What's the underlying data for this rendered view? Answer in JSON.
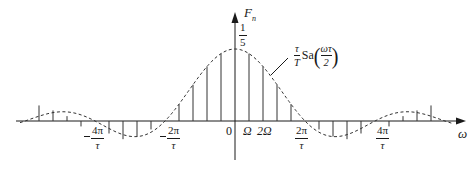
{
  "figure": {
    "y_axis_label": "F",
    "y_axis_subscript": "n",
    "x_axis_label": "ω",
    "peak_value": {
      "numerator": "1",
      "denominator": "5"
    },
    "origin_label": "0",
    "omega_labels": [
      "Ω",
      "2Ω"
    ],
    "envelope_annotation": {
      "coef_num": "τ",
      "coef_den": "T",
      "func": "Sa",
      "arg_num": "ωτ",
      "arg_den": "2"
    },
    "tick_labels": [
      {
        "id": "neg-4pi",
        "numerator": "4π",
        "denominator": "τ",
        "negative": true
      },
      {
        "id": "neg-2pi",
        "numerator": "2π",
        "denominator": "τ",
        "negative": true
      },
      {
        "id": "pos-2pi",
        "numerator": "2π",
        "denominator": "τ",
        "negative": false
      },
      {
        "id": "pos-4pi",
        "numerator": "4π",
        "denominator": "τ",
        "negative": false
      }
    ],
    "colors": {
      "ink": "#1a1a1a",
      "line": "#333333",
      "background": "#ffffff"
    }
  },
  "chart_data": {
    "type": "line",
    "xlabel": "ω",
    "ylabel": "F_n",
    "envelope": "(τ/T)·Sa(ωτ/2)",
    "duty_ratio": "1/5",
    "peak": 0.2,
    "harmonic_spacing": "Ω",
    "zero_crossings": [
      "-4π/τ",
      "-2π/τ",
      "2π/τ",
      "4π/τ"
    ],
    "harmonics_n": [
      -14,
      -13,
      -12,
      -11,
      -9,
      -8,
      -7,
      -6,
      -4,
      -3,
      -2,
      -1,
      0,
      1,
      2,
      3,
      4,
      6,
      7,
      8,
      9,
      11,
      12,
      13,
      14
    ],
    "harmonic_values": [
      0.0432,
      0.0294,
      0.0135,
      -0.0151,
      -0.0347,
      -0.0505,
      -0.0432,
      -0.0234,
      0.0468,
      0.1009,
      0.1514,
      0.1871,
      0.2,
      0.1871,
      0.1514,
      0.1009,
      0.0468,
      -0.0234,
      -0.0432,
      -0.0505,
      -0.0347,
      -0.0151,
      0.0135,
      0.0294,
      0.0432
    ],
    "legend": "none",
    "grid": false
  }
}
